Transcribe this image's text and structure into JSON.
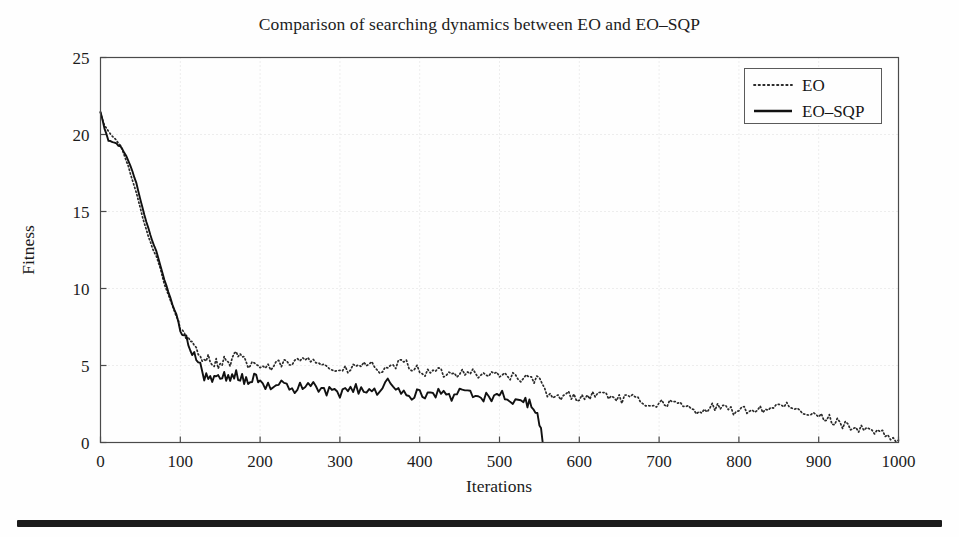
{
  "figure": {
    "title": "Comparison of searching dynamics between EO and EO–SQP",
    "background_color": "#fefefe",
    "axis_color": "#4a4a4a",
    "grid_color": "#dcdcdc",
    "series_colors": {
      "EO": "#2b2b2b",
      "EO–SQP": "#111111"
    },
    "bottom_rule_color": "#1b1b1b"
  },
  "axes": {
    "x": {
      "label": "Iterations",
      "ticks": [
        0,
        100,
        200,
        300,
        400,
        500,
        600,
        700,
        800,
        900,
        1000
      ],
      "tick_labels": [
        "0",
        "100",
        "200",
        "300",
        "400",
        "500",
        "600",
        "700",
        "800",
        "900",
        "1000"
      ],
      "min": 0,
      "max": 1000
    },
    "y": {
      "label": "Fitness",
      "ticks": [
        0,
        5,
        10,
        15,
        20,
        25
      ],
      "tick_labels": [
        "0",
        "5",
        "10",
        "15",
        "20",
        "25"
      ],
      "min": 0,
      "max": 25
    },
    "grid": "dotted"
  },
  "legend": {
    "position": "top-right",
    "entries": [
      {
        "label": "EO",
        "style": "dotted"
      },
      {
        "label": "EO–SQP",
        "style": "solid"
      }
    ]
  },
  "chart_data": {
    "type": "line",
    "title": "Comparison of searching dynamics between EO and EO–SQP",
    "xlabel": "Iterations",
    "ylabel": "Fitness",
    "xlim": [
      0,
      1000
    ],
    "ylim": [
      0,
      25
    ],
    "grid": true,
    "legend_position": "upper right",
    "series": [
      {
        "name": "EO",
        "style": "dotted",
        "x": [
          0,
          5,
          10,
          15,
          20,
          25,
          30,
          35,
          40,
          45,
          50,
          55,
          60,
          65,
          70,
          75,
          80,
          85,
          90,
          95,
          100,
          105,
          110,
          115,
          120,
          125,
          130,
          135,
          140,
          145,
          150,
          155,
          160,
          165,
          170,
          175,
          180,
          185,
          190,
          195,
          200,
          210,
          220,
          230,
          240,
          250,
          260,
          270,
          280,
          290,
          300,
          310,
          320,
          330,
          340,
          350,
          360,
          370,
          380,
          390,
          400,
          410,
          420,
          430,
          440,
          450,
          460,
          470,
          480,
          490,
          500,
          510,
          520,
          530,
          540,
          550,
          560,
          570,
          580,
          590,
          600,
          610,
          620,
          630,
          640,
          650,
          660,
          670,
          680,
          690,
          700,
          710,
          720,
          730,
          740,
          750,
          760,
          770,
          780,
          790,
          800,
          810,
          820,
          830,
          840,
          850,
          860,
          870,
          880,
          890,
          900,
          910,
          920,
          930,
          940,
          950,
          960,
          970,
          980,
          990,
          1000
        ],
        "y": [
          21.4,
          20.6,
          20.2,
          19.9,
          19.6,
          19.3,
          18.6,
          17.9,
          17.0,
          16.2,
          15.2,
          14.2,
          13.4,
          12.6,
          12.1,
          11.3,
          10.3,
          9.6,
          8.9,
          8.2,
          7.4,
          7.2,
          6.6,
          6.3,
          6.1,
          5.6,
          5.5,
          5.5,
          5.2,
          5.2,
          5.0,
          5.4,
          5.1,
          5.3,
          5.8,
          5.5,
          5.3,
          5.0,
          5.2,
          5.1,
          4.9,
          4.8,
          5.0,
          5.2,
          5.0,
          5.4,
          5.6,
          5.4,
          5.0,
          4.8,
          4.6,
          4.7,
          4.9,
          5.1,
          5.0,
          4.7,
          4.6,
          5.0,
          5.2,
          4.9,
          4.7,
          4.5,
          4.6,
          4.5,
          4.4,
          4.6,
          4.7,
          4.5,
          4.3,
          4.4,
          4.5,
          4.4,
          4.2,
          4.1,
          4.2,
          4.0,
          3.0,
          2.9,
          3.0,
          3.1,
          2.9,
          3.0,
          3.1,
          3.2,
          3.0,
          2.8,
          2.9,
          2.8,
          2.6,
          2.5,
          2.5,
          2.6,
          2.5,
          2.3,
          2.2,
          2.1,
          2.2,
          2.3,
          2.2,
          2.1,
          2.0,
          2.1,
          2.2,
          2.1,
          2.3,
          2.4,
          2.3,
          2.1,
          1.9,
          1.8,
          1.7,
          1.6,
          1.4,
          1.2,
          1.1,
          0.9,
          0.8,
          0.7,
          0.5,
          0.3,
          0.15
        ]
      },
      {
        "name": "EO–SQP",
        "style": "solid",
        "x": [
          0,
          5,
          10,
          15,
          20,
          25,
          30,
          35,
          40,
          45,
          50,
          55,
          60,
          65,
          70,
          75,
          80,
          85,
          90,
          95,
          100,
          105,
          110,
          115,
          120,
          125,
          130,
          135,
          140,
          145,
          150,
          155,
          160,
          165,
          170,
          175,
          180,
          185,
          190,
          195,
          200,
          210,
          220,
          230,
          240,
          250,
          260,
          270,
          280,
          290,
          300,
          310,
          320,
          330,
          340,
          350,
          360,
          370,
          380,
          390,
          400,
          410,
          420,
          430,
          440,
          450,
          460,
          470,
          480,
          490,
          500,
          510,
          520,
          530,
          535,
          540,
          545,
          550,
          552,
          554
        ],
        "y": [
          21.5,
          20.4,
          19.6,
          19.5,
          19.4,
          19.2,
          18.8,
          18.3,
          17.6,
          16.8,
          15.8,
          14.8,
          13.9,
          13.1,
          12.4,
          11.5,
          10.6,
          9.8,
          9.0,
          8.3,
          7.5,
          6.9,
          6.4,
          6.0,
          5.5,
          5.2,
          4.1,
          4.3,
          3.9,
          4.2,
          4.0,
          4.4,
          4.1,
          4.2,
          4.4,
          4.3,
          4.1,
          4.0,
          4.2,
          4.1,
          3.8,
          3.6,
          3.7,
          3.9,
          3.5,
          3.6,
          3.8,
          3.6,
          3.4,
          3.3,
          3.2,
          3.4,
          3.5,
          3.3,
          3.2,
          3.4,
          4.0,
          3.5,
          3.2,
          3.1,
          3.3,
          3.0,
          3.2,
          3.1,
          3.0,
          3.2,
          3.3,
          3.1,
          2.9,
          3.0,
          3.1,
          2.9,
          2.8,
          2.7,
          2.6,
          2.4,
          1.9,
          1.4,
          0.9,
          0.05
        ]
      }
    ]
  }
}
